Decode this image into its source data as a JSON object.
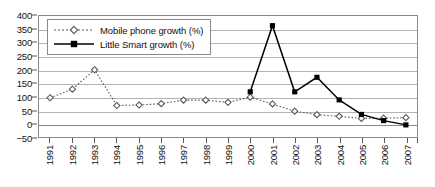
{
  "chart_data": {
    "type": "line",
    "title": "",
    "subtitle": "",
    "xlabel": "",
    "ylabel": "",
    "categories": [
      "1991",
      "1992",
      "1993",
      "1994",
      "1995",
      "1996",
      "1997",
      "1998",
      "1999",
      "2000",
      "2001",
      "2002",
      "2003",
      "2004",
      "2005",
      "2006",
      "2007"
    ],
    "ylim": [
      -50,
      400
    ],
    "ytick_labels": [
      "400",
      "350",
      "300",
      "250",
      "200",
      "150",
      "100",
      "50",
      "0",
      "−50"
    ],
    "ytick_values": [
      400,
      350,
      300,
      250,
      200,
      150,
      100,
      50,
      0,
      -50
    ],
    "ytick_step": 50,
    "grid": {
      "horizontal": true,
      "vertical": false
    },
    "legend": {
      "position": "top-left-inside",
      "border": true
    },
    "series": [
      {
        "name": "Mobile phone growth (%)",
        "line_style": "dotted",
        "marker": "open-diamond",
        "color": "#595959",
        "values": [
          96,
          128,
          200,
          67,
          69,
          74,
          87,
          87,
          79,
          98,
          73,
          46,
          33,
          27,
          19,
          20,
          22
        ]
      },
      {
        "name": "Little Smart growth (%)",
        "line_style": "solid",
        "marker": "filled-square",
        "color": "#000000",
        "values": [
          null,
          null,
          null,
          null,
          null,
          null,
          null,
          null,
          null,
          118,
          364,
          118,
          172,
          88,
          34,
          11,
          -5
        ]
      }
    ]
  },
  "legend": {
    "entries": [
      {
        "label": "Mobile phone growth (%)",
        "key": "dotted-open-diamond"
      },
      {
        "label": "Little Smart growth (%)",
        "key": "solid-filled-square"
      }
    ]
  },
  "colors": {
    "background": "#ffffff",
    "gridline": "#b3b3b3",
    "axis": "#8a8a8a",
    "series1": "#595959",
    "series2": "#000000",
    "text": "#111111"
  }
}
